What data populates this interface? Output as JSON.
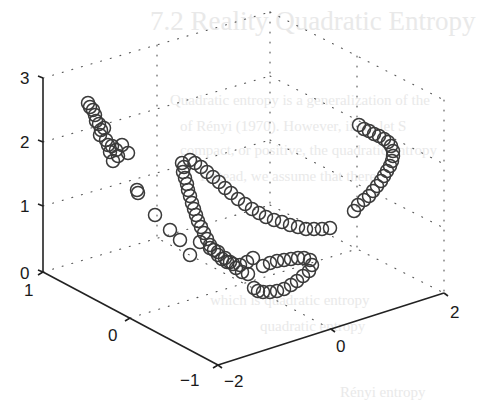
{
  "chart_data": {
    "type": "scatter",
    "dimensions": 3,
    "title": "",
    "xlabel": "",
    "ylabel": "",
    "zlabel": "",
    "marker": "open-circle",
    "marker_color": "#3a3a3a",
    "grid": true,
    "grid_style": "dotted",
    "legend": null,
    "xlim": [
      -2,
      2
    ],
    "ylim": [
      -1,
      1
    ],
    "zlim": [
      0,
      3
    ],
    "xticks": [
      -2,
      0,
      2
    ],
    "yticks": [
      -1,
      0,
      1
    ],
    "zticks": [
      0,
      1,
      2,
      3
    ],
    "xtick_labels": [
      "−2",
      "0",
      "2"
    ],
    "ytick_labels": [
      "−1",
      "0",
      "1"
    ],
    "ztick_labels": [
      "0",
      "1",
      "2",
      "3"
    ],
    "screen_points": [
      [
        88,
        103
      ],
      [
        90,
        107
      ],
      [
        93,
        110
      ],
      [
        95,
        115
      ],
      [
        96,
        121
      ],
      [
        99,
        124
      ],
      [
        101,
        130
      ],
      [
        104,
        128
      ],
      [
        100,
        135
      ],
      [
        106,
        140
      ],
      [
        108,
        145
      ],
      [
        112,
        146
      ],
      [
        110,
        152
      ],
      [
        116,
        150
      ],
      [
        118,
        156
      ],
      [
        122,
        145
      ],
      [
        128,
        153
      ],
      [
        113,
        161
      ],
      [
        137,
        190
      ],
      [
        138,
        193
      ],
      [
        155,
        215
      ],
      [
        170,
        230
      ],
      [
        180,
        240
      ],
      [
        190,
        255
      ],
      [
        182,
        163
      ],
      [
        184,
        167
      ],
      [
        183,
        172
      ],
      [
        185,
        178
      ],
      [
        187,
        184
      ],
      [
        188,
        190
      ],
      [
        190,
        196
      ],
      [
        192,
        203
      ],
      [
        194,
        209
      ],
      [
        196,
        215
      ],
      [
        198,
        221
      ],
      [
        201,
        227
      ],
      [
        204,
        233
      ],
      [
        207,
        239
      ],
      [
        210,
        245
      ],
      [
        214,
        250
      ],
      [
        218,
        255
      ],
      [
        222,
        259
      ],
      [
        227,
        262
      ],
      [
        233,
        264
      ],
      [
        240,
        265
      ],
      [
        247,
        262
      ],
      [
        253,
        258
      ],
      [
        190,
        160
      ],
      [
        195,
        163
      ],
      [
        201,
        167
      ],
      [
        207,
        172
      ],
      [
        213,
        177
      ],
      [
        219,
        182
      ],
      [
        225,
        188
      ],
      [
        231,
        193
      ],
      [
        238,
        199
      ],
      [
        245,
        204
      ],
      [
        252,
        209
      ],
      [
        259,
        213
      ],
      [
        266,
        217
      ],
      [
        274,
        220
      ],
      [
        282,
        222
      ],
      [
        290,
        225
      ],
      [
        298,
        227
      ],
      [
        306,
        229
      ],
      [
        314,
        229
      ],
      [
        322,
        229
      ],
      [
        330,
        228
      ],
      [
        200,
        242
      ],
      [
        210,
        248
      ],
      [
        218,
        252
      ],
      [
        225,
        258
      ],
      [
        230,
        262
      ],
      [
        236,
        268
      ],
      [
        242,
        272
      ],
      [
        248,
        274
      ],
      [
        263,
        266
      ],
      [
        270,
        263
      ],
      [
        277,
        261
      ],
      [
        284,
        260
      ],
      [
        291,
        259
      ],
      [
        298,
        258
      ],
      [
        304,
        258
      ],
      [
        310,
        260
      ],
      [
        312,
        265
      ],
      [
        309,
        271
      ],
      [
        303,
        276
      ],
      [
        297,
        281
      ],
      [
        291,
        285
      ],
      [
        284,
        289
      ],
      [
        277,
        291
      ],
      [
        270,
        292
      ],
      [
        263,
        292
      ],
      [
        258,
        291
      ],
      [
        254,
        288
      ],
      [
        359,
        125
      ],
      [
        364,
        129
      ],
      [
        369,
        131
      ],
      [
        374,
        134
      ],
      [
        379,
        136
      ],
      [
        384,
        139
      ],
      [
        388,
        142
      ],
      [
        391,
        146
      ],
      [
        393,
        151
      ],
      [
        393,
        156
      ],
      [
        392,
        161
      ],
      [
        390,
        166
      ],
      [
        387,
        171
      ],
      [
        384,
        176
      ],
      [
        381,
        181
      ],
      [
        377,
        186
      ],
      [
        373,
        191
      ],
      [
        369,
        196
      ],
      [
        364,
        200
      ],
      [
        358,
        205
      ],
      [
        354,
        211
      ]
    ]
  },
  "background": {
    "ghost_text": [
      "7.2 Reality Quadratic Entropy",
      "Quadratic entropy is a generalization of the",
      "of Rényi (1970). However, if we let S",
      "compact, or positive, the quadratic entropy",
      "Instead, we assume that there",
      "which is quadratic entropy",
      "quadratic entropy",
      "Rényi entropy"
    ]
  }
}
